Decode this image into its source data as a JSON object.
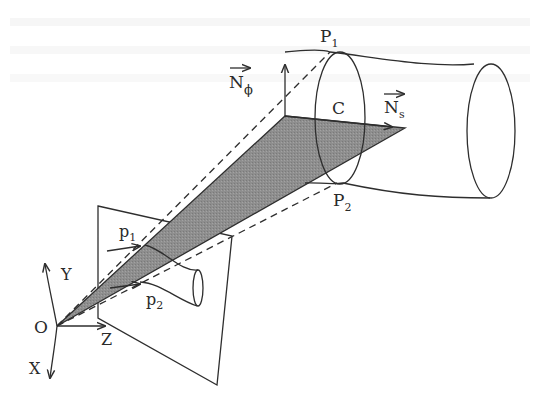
{
  "diagram": {
    "colors": {
      "line": "#2e2e2e",
      "shaded_plane": "#8c8c8c",
      "background": "#ffffff"
    },
    "labels": {
      "origin": "O",
      "axis_x": "X",
      "axis_y": "Y",
      "axis_z": "Z",
      "image_point_1": "p",
      "image_point_1_sub": "1",
      "image_point_2": "p",
      "image_point_2_sub": "2",
      "surface_point_1": "P",
      "surface_point_1_sub": "1",
      "surface_point_2": "P",
      "surface_point_2_sub": "2",
      "cross_section": "C",
      "normal_phi": "N",
      "normal_phi_sub": "ϕ",
      "normal_s": "N",
      "normal_s_sub": "s"
    },
    "nodes": [
      {
        "id": "O",
        "label": "O",
        "role": "camera center / origin"
      },
      {
        "id": "p1",
        "label": "p1",
        "role": "image contour point"
      },
      {
        "id": "p2",
        "label": "p2",
        "role": "image contour point"
      },
      {
        "id": "P1",
        "label": "P1",
        "role": "surface contour point"
      },
      {
        "id": "P2",
        "label": "P2",
        "role": "surface contour point"
      },
      {
        "id": "C",
        "label": "C",
        "role": "cross-section curve"
      },
      {
        "id": "Nphi",
        "label": "N_phi",
        "role": "normal vector"
      },
      {
        "id": "Ns",
        "label": "N_s",
        "role": "normal vector"
      }
    ],
    "edges": [
      {
        "from": "O",
        "to": "P1",
        "style": "dashed",
        "through": "p1"
      },
      {
        "from": "O",
        "to": "P2",
        "style": "dashed",
        "through": "p2"
      },
      {
        "from": "O",
        "to": "Ns",
        "style": "shaded-plane"
      }
    ]
  }
}
